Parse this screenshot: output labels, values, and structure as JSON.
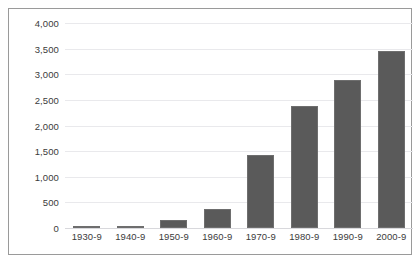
{
  "chart_data": {
    "type": "bar",
    "title": "",
    "subtitle": "",
    "xlabel": "",
    "ylabel": "",
    "categories": [
      "1930-9",
      "1940-9",
      "1950-9",
      "1960-9",
      "1970-9",
      "1980-9",
      "1990-9",
      "2000-9"
    ],
    "values": [
      20,
      35,
      150,
      375,
      1420,
      2390,
      2880,
      3450
    ],
    "ylim": [
      0,
      4000
    ],
    "ytick_values": [
      0,
      500,
      1000,
      1500,
      2000,
      2500,
      3000,
      3500,
      4000
    ],
    "ytick_labels": [
      "0",
      "500",
      "1,000",
      "1,500",
      "2,000",
      "2,500",
      "3,000",
      "3,500",
      "4,000"
    ],
    "grid": true,
    "legend": false,
    "legend_position": "none",
    "bar_color": "#5a5a5a",
    "bar_border_color": "#6e6e6e",
    "gridline_color": "#e9e9ec",
    "frame_color": "#9a9a9a",
    "background_color": "#ffffff",
    "text_color": "#3b3b3b",
    "annotations": []
  }
}
